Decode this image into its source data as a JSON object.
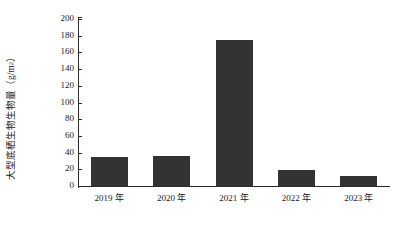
{
  "chart_data": {
    "type": "bar",
    "title": "",
    "xlabel": "",
    "ylabel": "大型底栖生物生物量（g/m²）",
    "ylabel_text": "大型底栖生物生物量（g/m",
    "ylabel_sup": "2",
    "ylabel_tail": "）",
    "categories": [
      "2019 年",
      "2020 年",
      "2021 年",
      "2022 年",
      "2023 年"
    ],
    "values": [
      35,
      36,
      175,
      19,
      12
    ],
    "ylim": [
      0,
      200
    ],
    "ytick_values": [
      0,
      20,
      40,
      60,
      80,
      100,
      120,
      140,
      160,
      180,
      200
    ],
    "ytick_labels": [
      "0",
      "20",
      "40",
      "60",
      "80",
      "100",
      "120",
      "140",
      "160",
      "180",
      "200"
    ],
    "grid": false,
    "legend": null,
    "bar_color": "#333333",
    "axis_color": "#2b2b2b",
    "background": "#ffffff"
  }
}
